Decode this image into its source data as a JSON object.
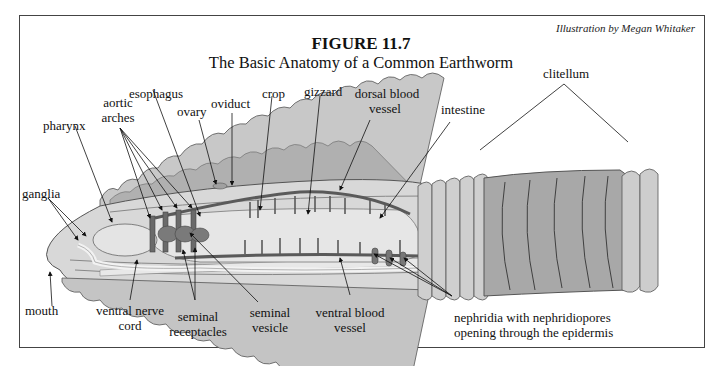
{
  "figure": {
    "number": "FIGURE 11.7",
    "title": "The Basic Anatomy of a Common Earthworm",
    "credit": "Illustration by Megan Whitaker"
  },
  "labels": {
    "esophagus": "esophagus",
    "aortic_arches_1": "aortic",
    "aortic_arches_2": "arches",
    "ovary": "ovary",
    "oviduct": "oviduct",
    "crop": "crop",
    "gizzard": "gizzard",
    "dorsal_blood_vessel_1": "dorsal blood",
    "dorsal_blood_vessel_2": "vessel",
    "intestine": "intestine",
    "clitellum": "clitellum",
    "pharynx": "pharynx",
    "ganglia": "ganglia",
    "mouth": "mouth",
    "ventral_nerve_cord_1": "ventral nerve",
    "ventral_nerve_cord_2": "cord",
    "seminal_receptacles_1": "seminal",
    "seminal_receptacles_2": "receptacles",
    "seminal_vesicle_1": "seminal",
    "seminal_vesicle_2": "vesicle",
    "ventral_blood_vessel_1": "ventral blood",
    "ventral_blood_vessel_2": "vessel",
    "nephridia_1": "nephridia with nephridiopores",
    "nephridia_2": "opening through the epidermis"
  },
  "colors": {
    "body_light": "#d4d4d4",
    "body_mid": "#b8b8b8",
    "body_dark": "#9c9c9c",
    "vessel": "#5a5a5a",
    "clitellum": "#a8a8a8",
    "outline": "#555555"
  }
}
